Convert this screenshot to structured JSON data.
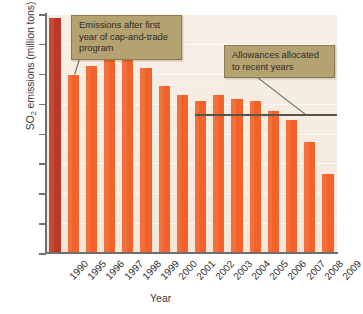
{
  "chart_data": {
    "type": "bar",
    "title": "",
    "xlabel": "Year",
    "ylabel": "SO2 emissions (million tons)",
    "ylabel_parts": {
      "prefix": "SO",
      "sub": "2",
      "suffix": " emissions (million tons)"
    },
    "categories": [
      "1990",
      "1995",
      "1996",
      "1997",
      "1998",
      "1999",
      "2000",
      "2001",
      "2002",
      "2003",
      "2004",
      "2005",
      "2006",
      "2007",
      "2008",
      "2009"
    ],
    "values": [
      15.7,
      11.9,
      12.5,
      12.9,
      13.0,
      12.4,
      11.2,
      10.6,
      10.2,
      10.6,
      10.3,
      10.2,
      9.5,
      8.9,
      7.4,
      5.3
    ],
    "bar_colors": [
      "#bc3a24",
      "#f2622a",
      "#f2622a",
      "#f2622a",
      "#f2622a",
      "#f2622a",
      "#f2622a",
      "#f2622a",
      "#f2622a",
      "#f2622a",
      "#f2622a",
      "#f2622a",
      "#f2622a",
      "#f2622a",
      "#f2622a",
      "#f2622a"
    ],
    "ylim": [
      0,
      16
    ],
    "yticks": [
      0,
      2,
      4,
      6,
      8,
      10,
      12,
      14,
      16
    ],
    "ytick_labels": [
      "0",
      "2",
      "4",
      "6",
      "8",
      "10",
      "12",
      "14",
      "16"
    ],
    "grid": true,
    "legend": "none",
    "reference_lines": [
      {
        "name": "allowances",
        "value": 9.3,
        "start_category": "2002",
        "end_category": "2009",
        "color": "#59534c"
      }
    ],
    "annotations": [
      {
        "id": "annotation-emissions",
        "text": "Emissions after first year of cap-and-trade program",
        "points_to": "1995"
      },
      {
        "id": "annotation-allowances",
        "text": "Allowances allocated to recent years",
        "points_to": "allowances-line"
      }
    ],
    "plot_background": "#f6ece2",
    "axis_color": "#6f6f6f"
  },
  "annotations": {
    "emissions": "Emissions after first year of cap-and-trade program",
    "allowances": "Allowances allocated to recent years"
  }
}
